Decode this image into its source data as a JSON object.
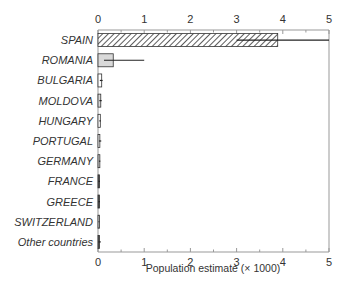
{
  "chart_data": {
    "type": "bar",
    "orientation": "horizontal",
    "title": "",
    "xlabel": "Population estimate (× 1000)",
    "ylabel": "",
    "xlim": [
      0,
      5
    ],
    "xticks": [
      0,
      1,
      2,
      3,
      4,
      5
    ],
    "x_minor_ticks": [
      0.5,
      1.5,
      2.5,
      3.5,
      4.5
    ],
    "grid": false,
    "legend": null,
    "top_axis_labels": true,
    "categories": [
      "SPAIN",
      "ROMANIA",
      "BULGARIA",
      "MOLDOVA",
      "HUNGARY",
      "PORTUGAL",
      "GERMANY",
      "FRANCE",
      "GREECE",
      "SWITZERLAND",
      "Other countries"
    ],
    "values": [
      3.89,
      0.33,
      0.08,
      0.06,
      0.05,
      0.04,
      0.04,
      0.02,
      0.03,
      0.02,
      0.03
    ],
    "error_low": [
      3.0,
      0.13,
      0.04,
      0.03,
      0.03,
      0.02,
      0.02,
      0.01,
      0.01,
      0.01,
      0.01
    ],
    "error_high": [
      5.0,
      1.0,
      0.1,
      0.08,
      0.06,
      0.07,
      0.05,
      0.04,
      0.04,
      0.03,
      0.06
    ],
    "styles": [
      "hatched",
      "gray",
      "outline",
      "gray",
      "outline",
      "outline",
      "gray",
      "dark",
      "dark",
      "gray",
      "dark"
    ],
    "colors": {
      "hatch": "#333333",
      "gray_fill": "#d9d9d9",
      "axis": "#999999",
      "bar_edge": "#333333",
      "error": "#222222"
    }
  }
}
